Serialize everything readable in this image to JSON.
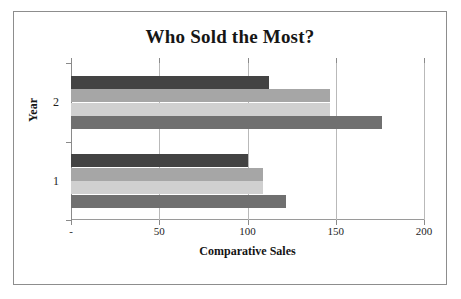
{
  "chart_data": {
    "type": "bar",
    "orientation": "horizontal",
    "title": "Who Sold the Most?",
    "xlabel": "Comparative Sales",
    "ylabel": "Year",
    "categories": [
      "1",
      "2"
    ],
    "xlim": [
      0,
      200
    ],
    "xticks": [
      0,
      50,
      100,
      150,
      200
    ],
    "xtick_labels": [
      "-",
      "50",
      "100",
      "150",
      "200"
    ],
    "grid": true,
    "legend": "none",
    "series": [
      {
        "name": "Series 1",
        "color": "#434343",
        "values": [
          100,
          112
        ]
      },
      {
        "name": "Series 2",
        "color": "#a6a6a6",
        "values": [
          109,
          147
        ]
      },
      {
        "name": "Series 3",
        "color": "#d0d0d0",
        "values": [
          109,
          147
        ]
      },
      {
        "name": "Series 4",
        "color": "#707070",
        "values": [
          122,
          176
        ]
      }
    ],
    "bars": [
      {
        "group": "2",
        "series": "Series 1",
        "value": 112,
        "color": "#434343"
      },
      {
        "group": "2",
        "series": "Series 2",
        "value": 147,
        "color": "#a6a6a6"
      },
      {
        "group": "2",
        "series": "Series 3",
        "value": 147,
        "color": "#d0d0d0"
      },
      {
        "group": "2",
        "series": "Series 4",
        "value": 176,
        "color": "#707070"
      },
      {
        "group": "1",
        "series": "Series 1",
        "value": 100,
        "color": "#434343"
      },
      {
        "group": "1",
        "series": "Series 2",
        "value": 109,
        "color": "#a6a6a6"
      },
      {
        "group": "1",
        "series": "Series 3",
        "value": 109,
        "color": "#d0d0d0"
      },
      {
        "group": "1",
        "series": "Series 4",
        "value": 122,
        "color": "#707070"
      }
    ]
  },
  "axis": {
    "x_ticks": [
      {
        "label": "-",
        "value": 0
      },
      {
        "label": "50",
        "value": 50
      },
      {
        "label": "100",
        "value": 100
      },
      {
        "label": "150",
        "value": 150
      },
      {
        "label": "200",
        "value": 200
      }
    ],
    "y_ticks": [
      {
        "label": "2"
      },
      {
        "label": "1"
      }
    ]
  },
  "colors": {
    "frame_border": "#8d8d8d",
    "gridline": "#b9b9b9",
    "axis_line": "#8a8a8a",
    "text": "#161616",
    "plot_background": "#ffffff"
  }
}
